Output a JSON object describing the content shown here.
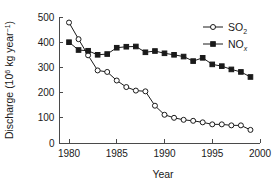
{
  "chart_data": {
    "type": "line",
    "title": "",
    "xlabel": "Year",
    "ylabel": "Discharge (10^6 kg year^-1)",
    "ylabel_parts": {
      "main": "Discharge (10",
      "sup1": "6",
      "mid": " kg year",
      "sup2": "−1",
      "end": ")"
    },
    "xlim": [
      1979,
      2000
    ],
    "ylim": [
      0,
      500
    ],
    "xticks": [
      1980,
      1985,
      1990,
      1995,
      2000
    ],
    "xtick_labels": [
      "1980",
      "1985",
      "1990",
      "1995",
      "2000"
    ],
    "yticks": [
      0,
      100,
      200,
      300,
      400,
      500
    ],
    "ytick_labels": [
      "0",
      "100",
      "200",
      "300",
      "400",
      "500"
    ],
    "grid": false,
    "legend_position": "top-right",
    "x": [
      1980,
      1981,
      1982,
      1983,
      1984,
      1985,
      1986,
      1987,
      1988,
      1989,
      1990,
      1991,
      1992,
      1993,
      1994,
      1995,
      1996,
      1997,
      1998,
      1999
    ],
    "series": [
      {
        "name": "SO2",
        "label_main": "SO",
        "label_sub": "2",
        "marker": "open-circle",
        "color": "#1a1a1a",
        "values": [
          478,
          412,
          348,
          288,
          282,
          248,
          222,
          208,
          205,
          148,
          112,
          100,
          92,
          88,
          82,
          74,
          74,
          70,
          70,
          52
        ]
      },
      {
        "name": "NOx",
        "label_main": "NO",
        "label_sub": "x",
        "marker": "filled-square",
        "color": "#1a1a1a",
        "values": [
          400,
          369,
          366,
          350,
          353,
          378,
          382,
          383,
          360,
          365,
          356,
          350,
          343,
          325,
          338,
          312,
          305,
          292,
          282,
          262
        ]
      }
    ]
  },
  "legend": {
    "entries": [
      {
        "label_main": "SO",
        "label_sub": "2",
        "marker": "open-circle"
      },
      {
        "label_main": "NO",
        "label_sub": "x",
        "marker": "filled-square"
      }
    ]
  }
}
